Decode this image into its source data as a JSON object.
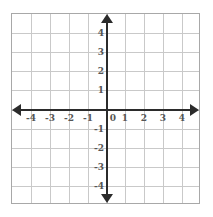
{
  "figure": {
    "background_color": "#ffffff",
    "border_color": "#a8a8a8",
    "grid_color": "#c9c9c9",
    "axis_color": "#2b2b2b",
    "label_color": "#555555"
  },
  "chart_data": {
    "type": "scatter",
    "title": "",
    "xlabel": "",
    "ylabel": "",
    "xlim": [
      -5,
      5
    ],
    "ylim": [
      -5,
      5
    ],
    "grid": true,
    "grid_step": 1,
    "legend": "none",
    "series": [],
    "x_tick_labels": [
      "-4",
      "-3",
      "-2",
      "-1",
      "0",
      "1",
      "2",
      "3",
      "4"
    ],
    "x_tick_values": [
      -4,
      -3,
      -2,
      -1,
      0,
      1,
      2,
      3,
      4
    ],
    "y_tick_labels": [
      "4",
      "3",
      "2",
      "1",
      "-1",
      "-2",
      "-3",
      "-4"
    ],
    "y_tick_values": [
      4,
      3,
      2,
      1,
      -1,
      -2,
      -3,
      -4
    ],
    "axes": {
      "x_axis_arrows": [
        "left",
        "right"
      ],
      "y_axis_arrows": [
        "up",
        "down"
      ],
      "origin_label": "0"
    }
  }
}
